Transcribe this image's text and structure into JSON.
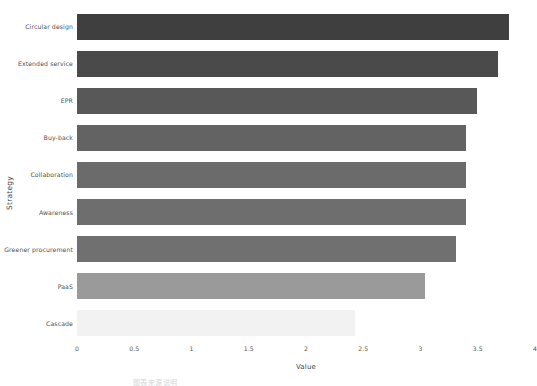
{
  "chart_data": {
    "type": "bar",
    "orientation": "horizontal",
    "title": "",
    "xlabel": "Value",
    "ylabel": "Strategy",
    "xlim": [
      0,
      4
    ],
    "xticks": [
      "0",
      "0.5",
      "1",
      "1.5",
      "2",
      "2.5",
      "3",
      "3.5",
      "4"
    ],
    "xtick_values": [
      0,
      0.5,
      1,
      1.5,
      2,
      2.5,
      3,
      3.5,
      4
    ],
    "grid": false,
    "legend": "none",
    "categories": [
      "Circular design",
      "Extended service",
      "EPR",
      "Buy-back",
      "Collaboration",
      "Awareness",
      "Greener procurement",
      "PaaS",
      "Cascade"
    ],
    "values": [
      3.77,
      3.68,
      3.49,
      3.4,
      3.4,
      3.4,
      3.31,
      3.04,
      2.43
    ],
    "bar_colors": [
      "#3f3f3f",
      "#4a4a4a",
      "#585858",
      "#636363",
      "#6b6b6b",
      "#6e6e6e",
      "#707070",
      "#9a9a9a",
      "#f2f2f2"
    ]
  },
  "watermark": {
    "text": "图表来源说明"
  }
}
